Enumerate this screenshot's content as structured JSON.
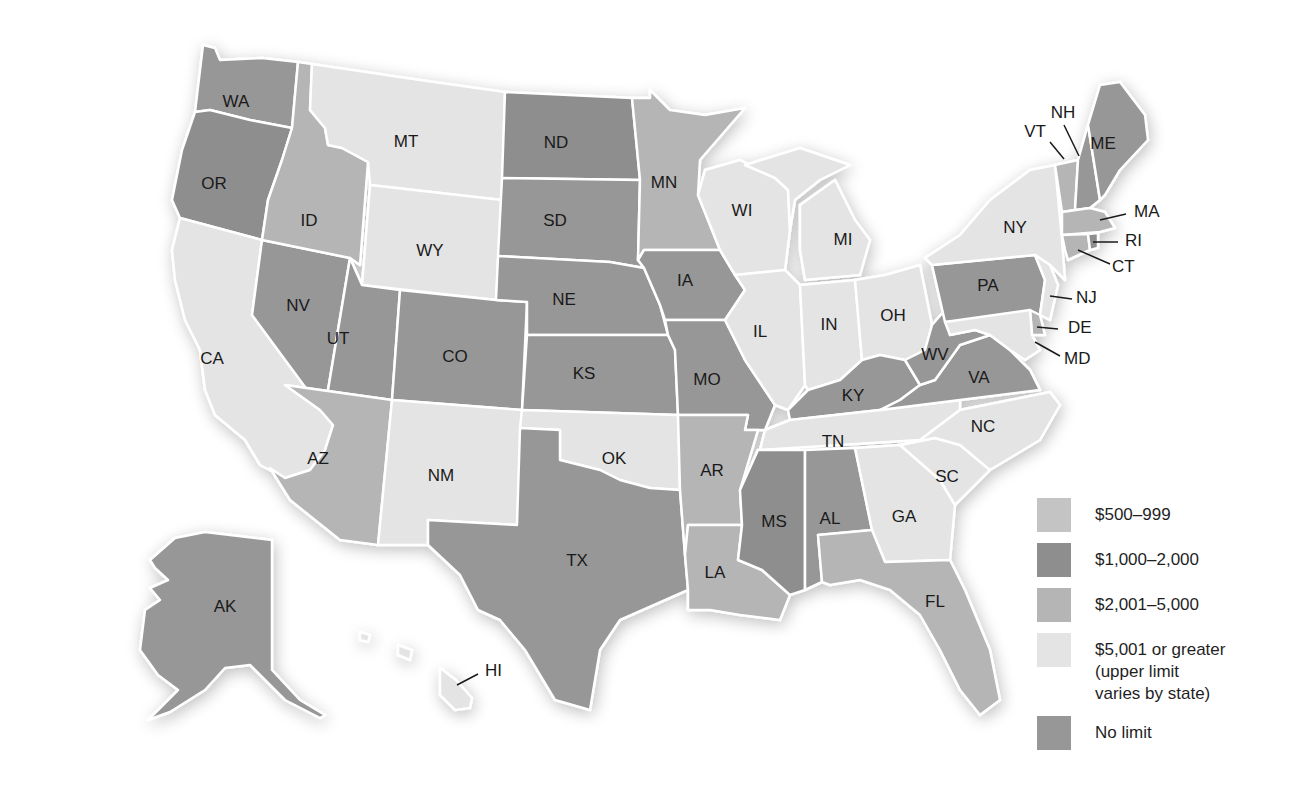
{
  "legend": {
    "items": [
      {
        "key": "c500",
        "label": "$500–999",
        "color": "#c4c4c4"
      },
      {
        "key": "c1000",
        "label": "$1,000–2,000",
        "color": "#8e8e8e"
      },
      {
        "key": "c2001",
        "label": "$2,001–5,000",
        "color": "#b5b5b5"
      },
      {
        "key": "c5001",
        "label": "$5,001 or greater\n(upper limit\nvaries by state)",
        "color": "#e4e4e4"
      },
      {
        "key": "none",
        "label": "No limit",
        "color": "#979797"
      }
    ]
  },
  "states": {
    "WA": "none",
    "OR": "c1000",
    "CA": "c5001",
    "NV": "none",
    "ID": "c2001",
    "MT": "c5001",
    "WY": "c5001",
    "UT": "none",
    "AZ": "c2001",
    "CO": "none",
    "NM": "c5001",
    "ND": "c1000",
    "SD": "none",
    "NE": "none",
    "KS": "none",
    "OK": "c5001",
    "TX": "none",
    "MN": "c2001",
    "IA": "none",
    "MO": "none",
    "AR": "c2001",
    "LA": "c2001",
    "WI": "c5001",
    "IL": "c5001",
    "MI": "c5001",
    "IN": "c5001",
    "OH": "c5001",
    "KY": "none",
    "TN": "c5001",
    "MS": "c1000",
    "AL": "none",
    "GA": "c5001",
    "FL": "c2001",
    "SC": "c5001",
    "NC": "c5001",
    "VA": "none",
    "WV": "none",
    "PA": "none",
    "NY": "c5001",
    "NJ": "c5001",
    "DE": "c2001",
    "MD": "c5001",
    "CT": "c2001",
    "RI": "c1000",
    "MA": "c2001",
    "VT": "c2001",
    "NH": "none",
    "ME": "none",
    "AK": "none",
    "HI": "c5001"
  },
  "labels": {
    "WA": "WA",
    "OR": "OR",
    "CA": "CA",
    "NV": "NV",
    "ID": "ID",
    "MT": "MT",
    "WY": "WY",
    "UT": "UT",
    "AZ": "AZ",
    "CO": "CO",
    "NM": "NM",
    "ND": "ND",
    "SD": "SD",
    "NE": "NE",
    "KS": "KS",
    "OK": "OK",
    "TX": "TX",
    "MN": "MN",
    "IA": "IA",
    "MO": "MO",
    "AR": "AR",
    "LA": "LA",
    "WI": "WI",
    "IL": "IL",
    "MI": "MI",
    "IN": "IN",
    "OH": "OH",
    "KY": "KY",
    "TN": "TN",
    "MS": "MS",
    "AL": "AL",
    "GA": "GA",
    "FL": "FL",
    "SC": "SC",
    "NC": "NC",
    "VA": "VA",
    "WV": "WV",
    "PA": "PA",
    "NY": "NY",
    "NJ": "NJ",
    "DE": "DE",
    "MD": "MD",
    "CT": "CT",
    "RI": "RI",
    "MA": "MA",
    "VT": "VT",
    "NH": "NH",
    "ME": "ME",
    "AK": "AK",
    "HI": "HI"
  }
}
